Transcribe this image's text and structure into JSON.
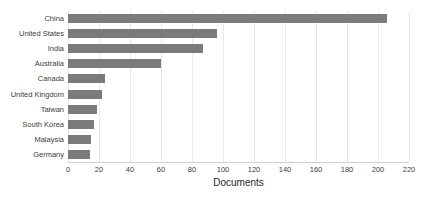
{
  "chart_data": {
    "type": "bar",
    "orientation": "horizontal",
    "title": "",
    "xlabel": "Documents",
    "ylabel": "",
    "xlim": [
      0,
      220
    ],
    "xticks": [
      0,
      20,
      40,
      60,
      80,
      100,
      120,
      140,
      160,
      180,
      200,
      220
    ],
    "grid": true,
    "legend": false,
    "bar_color": "#7b7b7b",
    "categories": [
      "China",
      "United States",
      "India",
      "Australia",
      "Canada",
      "United Kingdom",
      "Taiwan",
      "South Korea",
      "Malaysia",
      "Germany"
    ],
    "values": [
      206,
      96,
      87,
      60,
      24,
      22,
      19,
      17,
      15,
      14
    ]
  }
}
